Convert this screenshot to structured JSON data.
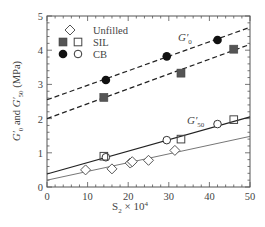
{
  "chart_data": {
    "type": "scatter",
    "title": "",
    "xlabel": "S₂ × 10⁴",
    "ylabel": "G′₀ and G′₅₀ (MPa)",
    "xlim": [
      0,
      50
    ],
    "ylim": [
      0,
      5
    ],
    "xticks": [
      0,
      10,
      20,
      30,
      40,
      50
    ],
    "yticks": [
      0,
      1,
      2,
      3,
      4,
      5
    ],
    "grid": false,
    "legend_position": "upper left",
    "legend": [
      {
        "label": "Unfilled",
        "markers": [
          "open-diamond"
        ]
      },
      {
        "label": "SIL",
        "markers": [
          "filled-square",
          "open-square"
        ]
      },
      {
        "label": "CB",
        "markers": [
          "filled-circle",
          "open-circle"
        ]
      }
    ],
    "annotations": [
      {
        "text": "G′₀",
        "x": 31,
        "y": 4.5
      },
      {
        "text": "G′₅₀",
        "x": 33,
        "y": 2.1
      }
    ],
    "series": [
      {
        "name": "CB G'0",
        "marker": "filled-circle",
        "x": [
          14.5,
          29.5,
          42
        ],
        "y": [
          3.13,
          3.82,
          4.3
        ]
      },
      {
        "name": "SIL G'0",
        "marker": "filled-square",
        "x": [
          14,
          33,
          46
        ],
        "y": [
          2.62,
          3.33,
          4.03
        ]
      },
      {
        "name": "CB G'50",
        "marker": "open-circle",
        "x": [
          14.5,
          29.5,
          42
        ],
        "y": [
          0.87,
          1.37,
          1.84
        ]
      },
      {
        "name": "SIL G'50",
        "marker": "open-square",
        "x": [
          14,
          33,
          46
        ],
        "y": [
          0.9,
          1.4,
          1.97
        ]
      },
      {
        "name": "Unfilled G'50",
        "marker": "open-diamond",
        "x": [
          9.5,
          16,
          20.5,
          21,
          25,
          31.5
        ],
        "y": [
          0.5,
          0.53,
          0.7,
          0.74,
          0.78,
          1.07
        ]
      }
    ],
    "fit_lines": [
      {
        "name": "CB G'0 fit",
        "style": "dashed",
        "x": [
          0,
          50
        ],
        "y": [
          2.55,
          4.67
        ]
      },
      {
        "name": "SIL G'0 fit",
        "style": "dashed",
        "x": [
          0,
          50
        ],
        "y": [
          2.0,
          4.17
        ]
      },
      {
        "name": "Filled G'50 fit",
        "style": "solid-dark",
        "x": [
          0,
          50
        ],
        "y": [
          0.38,
          2.05
        ]
      },
      {
        "name": "Unfilled G'50 fit",
        "style": "solid-light",
        "x": [
          0,
          50
        ],
        "y": [
          0.2,
          1.48
        ]
      }
    ]
  },
  "labels": {
    "xlabel_main": "S",
    "xlabel_sub": "2",
    "xlabel_rest": " × 10",
    "xlabel_sup": "4",
    "ann_g0_main": "G′",
    "ann_g0_sub": "0",
    "ann_g50_main": "G′",
    "ann_g50_sub": "50",
    "legend_unfilled": "Unfilled",
    "legend_sil": "SIL",
    "legend_cb": "CB"
  }
}
